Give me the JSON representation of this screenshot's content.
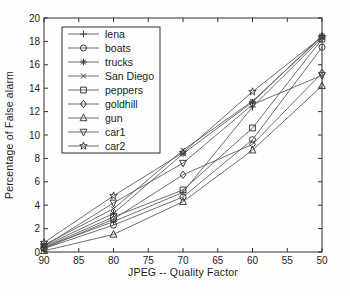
{
  "figure": {
    "background": "#fefefe",
    "axis_color": "#2e2e2e",
    "line_color": "#5f5f5f",
    "marker_color": "#3d3d3d",
    "text_color": "#1c1c1c",
    "legend_background": "#fdfdfd"
  },
  "chart_data": {
    "type": "line",
    "title": "",
    "xlabel": "JPEG -- Quality Factor",
    "ylabel": "Percentage of False alarm",
    "x": [
      90,
      80,
      70,
      60,
      50
    ],
    "x_axis_reversed": true,
    "xlim": [
      90,
      50
    ],
    "ylim": [
      0,
      20
    ],
    "xticks": [
      90,
      85,
      80,
      75,
      70,
      65,
      60,
      55,
      50
    ],
    "yticks": [
      0,
      2,
      4,
      6,
      8,
      10,
      12,
      14,
      16,
      18,
      20
    ],
    "grid": false,
    "legend_position": "upper-left",
    "series": [
      {
        "name": "lena",
        "marker": "plus",
        "values": [
          0.4,
          2.6,
          5.1,
          12.4,
          18.3
        ]
      },
      {
        "name": "boats",
        "marker": "circle",
        "values": [
          0.3,
          2.3,
          4.7,
          9.6,
          17.5
        ]
      },
      {
        "name": "trucks",
        "marker": "asterisk",
        "values": [
          0.5,
          3.3,
          8.4,
          12.8,
          18.5
        ]
      },
      {
        "name": "San Diego",
        "marker": "x",
        "values": [
          0.6,
          3.7,
          8.7,
          12.9,
          18.4
        ]
      },
      {
        "name": "peppers",
        "marker": "square",
        "values": [
          0.4,
          3.0,
          5.3,
          10.6,
          18.2
        ]
      },
      {
        "name": "goldhill",
        "marker": "diamond",
        "values": [
          0.3,
          2.8,
          6.6,
          9.2,
          15.3
        ]
      },
      {
        "name": "gun",
        "marker": "triangle-up",
        "values": [
          0.1,
          1.5,
          4.3,
          8.7,
          14.2
        ]
      },
      {
        "name": "car1",
        "marker": "triangle-down",
        "values": [
          0.5,
          4.2,
          7.6,
          12.6,
          15.1
        ]
      },
      {
        "name": "car2",
        "marker": "star",
        "values": [
          0.8,
          4.8,
          8.5,
          13.7,
          18.4
        ]
      }
    ]
  }
}
